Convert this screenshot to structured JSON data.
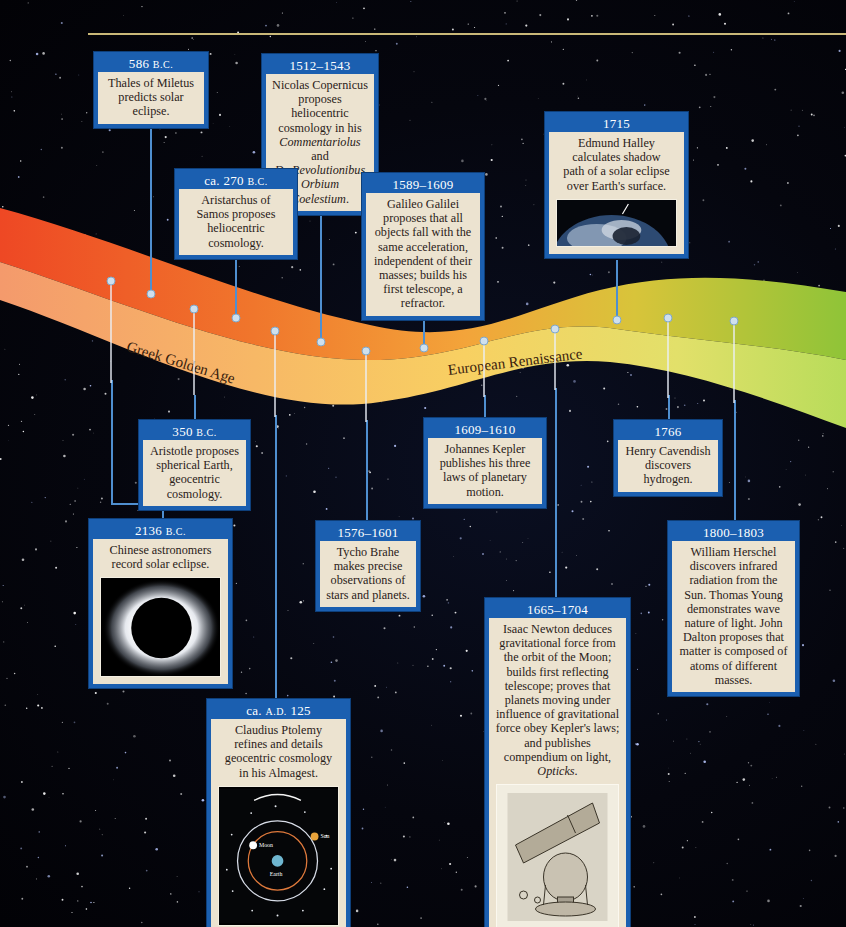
{
  "header": {
    "rule_color": "#c9b878"
  },
  "colors": {
    "card_header": "#1b5fb0",
    "card_body": "#ece3d0",
    "connector": "#4f8fd0",
    "band_start": "#ee4a24",
    "band_mid": "#f4a640",
    "band_end": "#9cc83a"
  },
  "eras": [
    {
      "label": "Greek Golden Age"
    },
    {
      "label": "European Renaissance"
    }
  ],
  "events": [
    {
      "id": "thales",
      "date": "586",
      "era_suffix": "B.C.",
      "text": "Thales of Miletus predicts solar eclipse."
    },
    {
      "id": "copernicus",
      "date": "1512–1543",
      "text_lines": [
        "Nicolas Copernicus",
        "proposes heliocentric",
        "cosmology in his"
      ],
      "italic_1": "Commentariolus",
      "and_word": " and",
      "italic_2": "De Revolutionibus",
      "italic_3": "Orbium Coelestium",
      "period": "."
    },
    {
      "id": "aristarchus",
      "date": "ca. 270",
      "era_suffix": "B.C.",
      "text": "Aristarchus of Samos proposes heliocentric cosmology."
    },
    {
      "id": "galileo",
      "date": "1589–1609",
      "text": "Galileo Galilei proposes that all objects fall with the same acceleration, independent of their masses; builds his first telescope, a refractor."
    },
    {
      "id": "halley",
      "date": "1715",
      "text": "Edmund Halley calculates shadow path of a solar eclipse over Earth's surface.",
      "image": "earth-eclipse-shadow-photo"
    },
    {
      "id": "aristotle",
      "date": "350",
      "era_suffix": "B.C.",
      "text": "Aristotle proposes spherical Earth, geocentric cosmology."
    },
    {
      "id": "kepler",
      "date": "1609–1610",
      "text": "Johannes Kepler publishes his three laws of planetary motion."
    },
    {
      "id": "cavendish",
      "date": "1766",
      "text": "Henry Cavendish discovers hydrogen."
    },
    {
      "id": "chinese",
      "date": "2136",
      "era_suffix": "B.C.",
      "text": "Chinese astronomers record solar eclipse.",
      "image": "solar-eclipse-corona-photo"
    },
    {
      "id": "tycho",
      "date": "1576–1601",
      "text": "Tycho Brahe makes precise observations of stars and planets."
    },
    {
      "id": "herschel",
      "date": "1800–1803",
      "text": "William Herschel discovers infrared radiation from the Sun. Thomas Young demonstrates wave nature of light. John Dalton proposes that matter is composed of atoms of different masses."
    },
    {
      "id": "newton",
      "date": "1665–1704",
      "text_main": "Isaac Newton deduces gravitational force from the orbit of the Moon; builds first reflecting telescope; proves that planets moving under influence of gravitational force obey Kepler's laws; and publishes compendium on light, ",
      "italic": "Opticks",
      "period": ".",
      "image": "newton-reflecting-telescope-drawing"
    },
    {
      "id": "ptolemy",
      "date": "ca.",
      "era_prefix": "A.D.",
      "date_num": "125",
      "text": "Claudius Ptolemy refines and details geocentric cosmology in his Almagest.",
      "image": "geocentric-orbit-diagram",
      "diagram_labels": {
        "moon": "Moon",
        "earth": "Earth",
        "sun": "Sun"
      }
    }
  ]
}
